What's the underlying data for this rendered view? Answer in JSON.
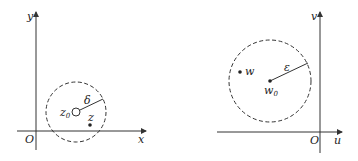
{
  "left": {
    "axes": {
      "x_label": "x",
      "y_label": "y",
      "origin_label": "O"
    },
    "center_label": "z",
    "center_sub": "0",
    "radius_label": "δ",
    "point_label": "z"
  },
  "right": {
    "axes": {
      "x_label": "u",
      "y_label": "v",
      "origin_label": "O"
    },
    "center_label": "w",
    "center_sub": "0",
    "radius_label": "ε",
    "point_label": "w"
  },
  "colors": {
    "stroke": "#333333",
    "background": "#ffffff"
  }
}
